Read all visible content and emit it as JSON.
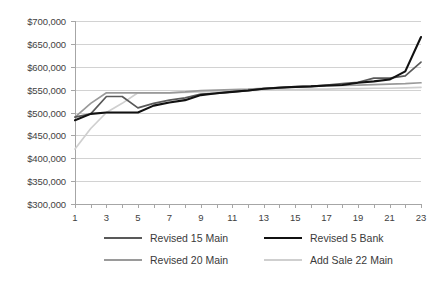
{
  "chart_data": {
    "type": "line",
    "title": "",
    "xlabel": "",
    "ylabel": "",
    "ylim": [
      300000,
      700000
    ],
    "ytick_step": 50000,
    "ytick_labels": [
      "$700,000",
      "$650,000",
      "$600,000",
      "$550,000",
      "$500,000",
      "$450,000",
      "$400,000",
      "$350,000",
      "$300,000"
    ],
    "ytick_values": [
      700000,
      650000,
      600000,
      550000,
      500000,
      450000,
      400000,
      350000,
      300000
    ],
    "xlim": [
      1,
      23
    ],
    "x": [
      1,
      2,
      3,
      4,
      5,
      6,
      7,
      8,
      9,
      10,
      11,
      12,
      13,
      14,
      15,
      16,
      17,
      18,
      19,
      20,
      21,
      22,
      23
    ],
    "xtick_labels": [
      "1",
      "3",
      "5",
      "7",
      "9",
      "11",
      "13",
      "15",
      "17",
      "19",
      "21",
      "23"
    ],
    "xtick_values": [
      1,
      3,
      5,
      7,
      9,
      11,
      13,
      15,
      17,
      19,
      21,
      23
    ],
    "grid": true,
    "legend_position": "bottom",
    "series": [
      {
        "name": "Revised 15 Main",
        "color": "#595959",
        "width": 1.7,
        "values": [
          490000,
          497000,
          535000,
          535000,
          510000,
          520000,
          527000,
          532000,
          540000,
          542000,
          545000,
          548000,
          552000,
          555000,
          556000,
          557000,
          560000,
          563000,
          566000,
          575000,
          575000,
          580000,
          610000
        ]
      },
      {
        "name": "Revised 5 Bank",
        "color": "#111111",
        "width": 2.1,
        "values": [
          483000,
          497000,
          500000,
          500000,
          500000,
          515000,
          522000,
          527000,
          538000,
          542000,
          545000,
          548000,
          552000,
          554000,
          556000,
          557000,
          559000,
          560000,
          565000,
          568000,
          572000,
          590000,
          665000
        ]
      },
      {
        "name": "Revised 20 Main",
        "color": "#9a9a9a",
        "width": 1.7,
        "values": [
          490000,
          520000,
          543000,
          543000,
          543000,
          543000,
          543000,
          545000,
          548000,
          549000,
          550000,
          551000,
          553000,
          554000,
          556000,
          557000,
          558000,
          559000,
          560000,
          561000,
          562000,
          563000,
          565000
        ]
      },
      {
        "name": "Add Sale 22 Main",
        "color": "#cfcfcf",
        "width": 1.7,
        "values": [
          420000,
          465000,
          500000,
          520000,
          543000,
          543000,
          543000,
          544000,
          545000,
          546000,
          547000,
          548000,
          549000,
          550000,
          550000,
          551000,
          551000,
          552000,
          552000,
          553000,
          553000,
          554000,
          555000
        ]
      }
    ]
  },
  "legend": {
    "items": [
      {
        "label": "Revised 15 Main"
      },
      {
        "label": "Revised 5 Bank"
      },
      {
        "label": "Revised 20 Main"
      },
      {
        "label": "Add Sale 22 Main"
      }
    ]
  }
}
